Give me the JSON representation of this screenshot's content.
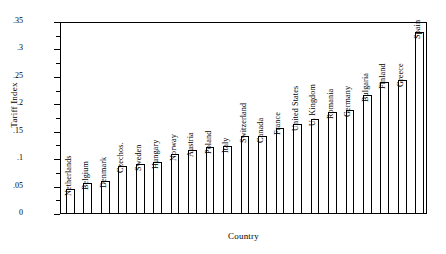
{
  "chart_data": {
    "type": "bar",
    "title": "",
    "xlabel": "Country",
    "ylabel": "Tariff Index",
    "ylim": [
      0,
      0.35
    ],
    "ytick_labels": [
      "0",
      ".05",
      ".1",
      ".15",
      ".2",
      ".25",
      ".3",
      ".35"
    ],
    "ytick_values": [
      0,
      0.05,
      0.1,
      0.15,
      0.2,
      0.25,
      0.3,
      0.35
    ],
    "grid": false,
    "legend": "none",
    "bar_fill_color": "#ffffff",
    "bar_edge_color": "#000000",
    "categories": [
      "Netherlands",
      "Belgium",
      "Denmark",
      "Czechos.",
      "Sweden",
      "Hungary",
      "Norway",
      "Austria",
      "Poland",
      "Italy",
      "Switzerland",
      "Canada",
      "France",
      "United States",
      "U. Kingdom",
      "Romania",
      "Germany",
      "Bulgaria",
      "Finland",
      "Greece",
      "Spain"
    ],
    "values": [
      0.043,
      0.055,
      0.058,
      0.085,
      0.09,
      0.093,
      0.108,
      0.115,
      0.12,
      0.122,
      0.14,
      0.14,
      0.155,
      0.162,
      0.172,
      0.185,
      0.187,
      0.215,
      0.238,
      0.243,
      0.33
    ]
  }
}
